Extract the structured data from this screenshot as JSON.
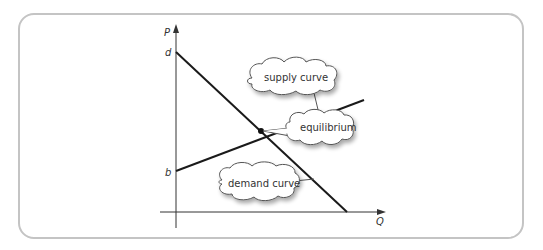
{
  "diagram": {
    "type": "supply-demand",
    "axes": {
      "y_label": "P",
      "x_label": "Q",
      "y_intercepts": {
        "demand": "d",
        "supply": "b"
      }
    },
    "callouts": {
      "supply": "supply curve",
      "equilibrium": "equilibrium",
      "demand": "demand curve"
    },
    "colors": {
      "line": "#1a1a1a",
      "axis": "#333333",
      "frame": "#c4c4c4",
      "bubble_border": "#666666"
    }
  }
}
